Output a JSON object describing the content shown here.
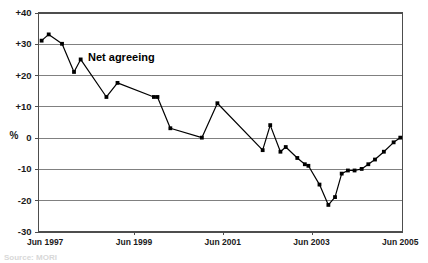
{
  "chart_data": {
    "type": "line",
    "title": "",
    "xlabel": "",
    "ylabel": "%",
    "series_label": "Net agreeing",
    "ylim": [
      -30,
      40
    ],
    "y_ticks": [
      "+40",
      "+30",
      "+20",
      "+10",
      "0",
      "-10",
      "-20",
      "-30"
    ],
    "y_tick_values": [
      40,
      30,
      20,
      10,
      0,
      -10,
      -20,
      -30
    ],
    "x_tick_labels": [
      "Jun 1997",
      "Jun 1999",
      "Jun 2001",
      "Jun 2003",
      "Jun 2005"
    ],
    "x_tick_values": [
      1997.45,
      1999.45,
      2001.45,
      2003.45,
      2005.45
    ],
    "xlim": [
      1997.3,
      2005.5
    ],
    "grid": true,
    "legend_position": "inline-annotation",
    "series": [
      {
        "name": "Net agreeing",
        "color": "#000000",
        "x": [
          1997.37,
          1997.53,
          1997.83,
          1998.1,
          1998.25,
          1998.83,
          1999.08,
          1999.9,
          1999.98,
          2000.27,
          2000.98,
          2001.33,
          2002.35,
          2002.52,
          2002.75,
          2002.87,
          2003.13,
          2003.3,
          2003.38,
          2003.63,
          2003.83,
          2003.98,
          2004.13,
          2004.27,
          2004.42,
          2004.58,
          2004.73,
          2004.88,
          2005.08,
          2005.3,
          2005.45
        ],
        "values": [
          31,
          33,
          30,
          21,
          25,
          13,
          17.5,
          13,
          13,
          3,
          0,
          11,
          -4,
          4,
          -4.5,
          -3,
          -6.5,
          -8.5,
          -9,
          -15,
          -21.5,
          -19,
          -11.5,
          -10.5,
          -10.5,
          -10,
          -8.5,
          -7,
          -4.5,
          -1.5,
          0
        ]
      }
    ]
  },
  "source_note": "Source: MORI"
}
